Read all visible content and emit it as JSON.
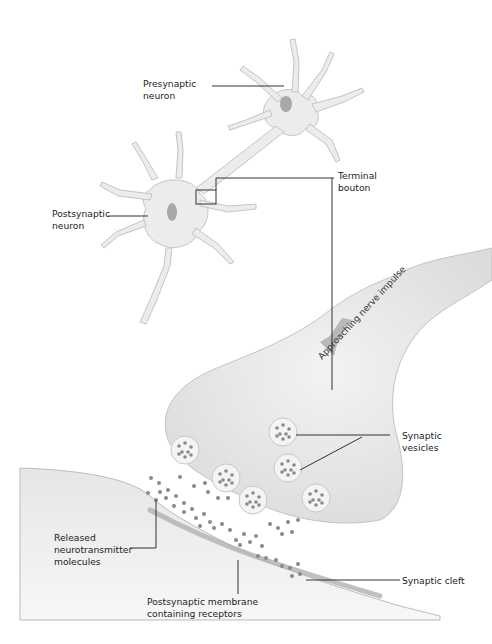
{
  "labels": {
    "presynaptic_neuron": "Presynaptic\nneuron",
    "postsynaptic_neuron": "Postsynaptic\nneuron",
    "terminal_bouton": "Terminal\nbouton",
    "approaching_impulse": "Approaching nerve impulse",
    "synaptic_vesicles": "Synaptic\nvesicles",
    "released_neurotransmitter": "Released\nneurotransmitter\nmolecules",
    "postsynaptic_membrane": "Postsynaptic membrane\ncontaining receptors",
    "synaptic_cleft": "Synaptic cleft"
  },
  "colors": {
    "cell_fill": "#ececec",
    "cell_edge": "#c4c4c4",
    "nucleus": "#a8a8a8",
    "leader": "#333333",
    "molecule": "#8a8a8a",
    "arrow": "#b8b8b8"
  }
}
